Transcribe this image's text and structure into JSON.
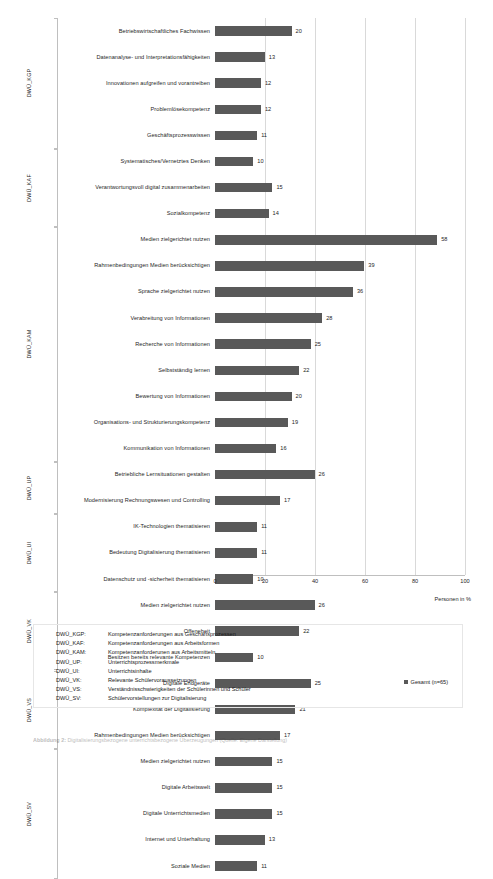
{
  "chart_data": {
    "type": "bar",
    "orientation": "horizontal",
    "title": "",
    "xlabel": "Personen in %",
    "ylabel": "",
    "xlim": [
      0,
      100
    ],
    "xticks": [
      0,
      20,
      40,
      60,
      80,
      100
    ],
    "grid": true,
    "legend_position": "bottom-right",
    "series": [
      {
        "name": "Gesamt (n=65)",
        "color": "#595959"
      }
    ],
    "groups": [
      {
        "code": "DWÜ_KGP",
        "categories": [
          "Betriebswirtschaftliches Fachwissen",
          "Datenanalyse- und Interpretationsfähigkeiten",
          "Innovationen aufgreifen und vorantreiben",
          "Problemlösekompetenz",
          "Geschäftsprozesswissen"
        ],
        "values": [
          20,
          13,
          12,
          12,
          11
        ]
      },
      {
        "code": "DWÜ_KAF",
        "categories": [
          "Systematisches/Vernetztes Denken",
          "Verantwortungsvoll digital zusammenarbeiten",
          "Sozialkompetenz"
        ],
        "values": [
          10,
          15,
          14
        ]
      },
      {
        "code": "DWÜ_KAM",
        "categories": [
          "Medien zielgerichtet nutzen",
          "Rahmenbedingungen Medien berücksichtigen",
          "Sprache zielgerichtet nutzen",
          "Verabreitung von Informationen",
          "Recherche von Informationen",
          "Selbstständig lernen",
          "Bewertung von Informationen",
          "Organisations- und Strukturierungskompetenz",
          "Kommunikation von Informationen"
        ],
        "values": [
          58,
          39,
          36,
          28,
          25,
          22,
          20,
          19,
          16
        ]
      },
      {
        "code": "DWÜ_UP",
        "categories": [
          "Betriebliche Lernsituationen gestalten",
          "Modernisierung Rechnungswesen und Controlling"
        ],
        "values": [
          26,
          17
        ]
      },
      {
        "code": "DWÜ_UI",
        "categories": [
          "IK-Technologien thematisieren",
          "Bedeutung Digitalisierung thematisieren",
          "Datenschutz und -sicherheit thematisieren"
        ],
        "values": [
          11,
          11,
          10
        ]
      },
      {
        "code": "DWÜ_VK",
        "categories": [
          "Medien zielgerichtet nutzen",
          "Offeneheit",
          "Besitzen bereits relevante Kompetenzen"
        ],
        "values": [
          26,
          22,
          10
        ]
      },
      {
        "code": "DWÜ_VS",
        "categories": [
          "Digitale Endgeräte",
          "Komplexität der Digitalisierung",
          "Rahmenbedingungen Medien berücksichtigen"
        ],
        "values": [
          25,
          21,
          17
        ]
      },
      {
        "code": "DWÜ_SV",
        "categories": [
          "Medien zielgerichtet nutzen",
          "Digitale Arbeitswelt",
          "Digitale Unterrichtsmedien",
          "Internet und Unterhaltung",
          "Soziale Medien"
        ],
        "values": [
          15,
          15,
          15,
          13,
          11
        ]
      }
    ]
  },
  "key_table": {
    "rows": [
      {
        "code": "DWÜ_KGP:",
        "desc": "Kompetenzanforderungen aus Geschäftsprozessen"
      },
      {
        "code": "DWÜ_KAF:",
        "desc": "Kompetenzanforderungen aus Arbeitsformen"
      },
      {
        "code": "DWÜ_KAM:",
        "desc": "Kompetenzanforderunen aus Arbeitsmitteln"
      },
      {
        "code": "DWÜ_UP:",
        "desc": "Unterrichtsprozessmerkmale"
      },
      {
        "code": "DWÜ_UI:",
        "desc": "Unterrichtsinhalte"
      },
      {
        "code": "DWÜ_VK:",
        "desc": "Relevante Schülervoraussetzungen"
      },
      {
        "code": "DWÜ_VS:",
        "desc": "Verständnisschwierigkeiten der Schülerinnen und Schüler"
      },
      {
        "code": "DWÜ_SV:",
        "desc": "Schülervorstellungen zur Digitalisierung"
      }
    ]
  },
  "caption": {
    "prefix": "Abbildung 2:",
    "text": "Digitalisierungsbezogene unterrichtsbezogene Überzeugungen (Quelle: Eigene Darstellung)"
  }
}
